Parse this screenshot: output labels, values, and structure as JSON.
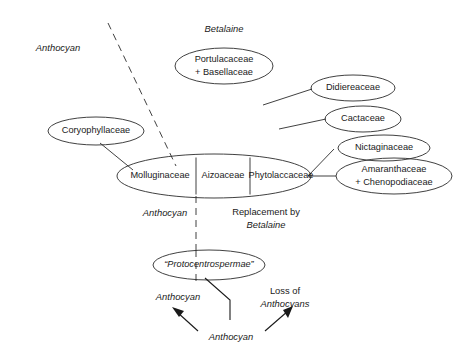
{
  "diagram": {
    "title_labels": {
      "anthocyan_top_left": "Anthocyan",
      "betalaine_top": "Betalaine",
      "anthocyan_center_left": "Anthocyan",
      "replacement_line1": "Replacement by",
      "replacement_line2": "Betalaine",
      "anthocyan_lower_left": "Anthocyan",
      "loss_line1": "Loss of",
      "loss_line2": "Anthocyans",
      "anthocyan_bottom": "Anthocyan"
    },
    "taxa": {
      "portulacaceae_line1": "Portulacaceae",
      "portulacaceae_line2": "+ Basellaceae",
      "didiereaceae": "Didiereaceae",
      "cactaceae": "Cactaceae",
      "nictaginaceae": "Nictaginaceae",
      "amaranthaceae_line1": "Amaranthaceae",
      "amaranthaceae_line2": "+ Chenopodiaceae",
      "coryophyllaceae": "Coryophyllaceae",
      "molluginaceae": "Molluginaceae",
      "aizoaceae": "Aizoaceae",
      "phytolaccaceae": "Phytolaccaceae",
      "protocentrospermae": "“Protocentrospermae”"
    },
    "colors": {
      "background": "#ffffff",
      "stroke": "#2b2b2b",
      "text": "#1a1a1a"
    }
  }
}
